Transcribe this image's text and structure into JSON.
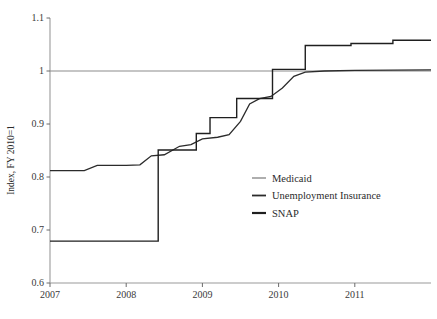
{
  "chart_data": {
    "type": "line",
    "title": "",
    "subtitle": "",
    "xlabel": "",
    "ylabel": "Index, FY 2010=1",
    "xlim": [
      2007.0,
      2012.0
    ],
    "ylim": [
      0.6,
      1.1
    ],
    "xticks": [
      2007,
      2008,
      2009,
      2010,
      2011
    ],
    "xticklabels": [
      "2007",
      "2008",
      "2009",
      "2010",
      "2011"
    ],
    "yticks": [
      0.6,
      0.7,
      0.8,
      0.9,
      1.0,
      1.1
    ],
    "yticklabels": [
      "0.6",
      "0.7",
      "0.8",
      "0.9",
      "1",
      "1.1"
    ],
    "grid": false,
    "legend_position": "center-right",
    "series": [
      {
        "name": "Medicaid",
        "color": "#8c8c8c",
        "width": 1.2,
        "step": false,
        "points": [
          [
            2007.0,
            1.0
          ],
          [
            2012.0,
            1.0
          ]
        ]
      },
      {
        "name": "Unemployment Insurance",
        "color": "#2b2b2b",
        "width": 1.3,
        "step": false,
        "points": [
          [
            2007.0,
            0.812
          ],
          [
            2007.45,
            0.812
          ],
          [
            2007.62,
            0.822
          ],
          [
            2008.0,
            0.822
          ],
          [
            2008.18,
            0.823
          ],
          [
            2008.33,
            0.84
          ],
          [
            2008.5,
            0.842
          ],
          [
            2008.7,
            0.858
          ],
          [
            2008.85,
            0.861
          ],
          [
            2009.0,
            0.872
          ],
          [
            2009.2,
            0.875
          ],
          [
            2009.35,
            0.88
          ],
          [
            2009.5,
            0.905
          ],
          [
            2009.62,
            0.938
          ],
          [
            2009.75,
            0.948
          ],
          [
            2009.9,
            0.952
          ],
          [
            2010.05,
            0.968
          ],
          [
            2010.2,
            0.99
          ],
          [
            2010.35,
            0.998
          ],
          [
            2010.6,
            1.0
          ],
          [
            2011.0,
            1.001
          ],
          [
            2012.0,
            1.002
          ]
        ]
      },
      {
        "name": "SNAP",
        "color": "#1f1f1f",
        "width": 1.4,
        "step": true,
        "points": [
          [
            2007.0,
            0.679
          ],
          [
            2008.42,
            0.679
          ],
          [
            2008.42,
            0.851
          ],
          [
            2008.92,
            0.851
          ],
          [
            2008.92,
            0.882
          ],
          [
            2009.1,
            0.882
          ],
          [
            2009.1,
            0.912
          ],
          [
            2009.45,
            0.912
          ],
          [
            2009.45,
            0.948
          ],
          [
            2009.92,
            0.948
          ],
          [
            2009.92,
            1.003
          ],
          [
            2010.35,
            1.003
          ],
          [
            2010.35,
            1.048
          ],
          [
            2010.95,
            1.048
          ],
          [
            2010.95,
            1.052
          ],
          [
            2011.5,
            1.052
          ],
          [
            2011.5,
            1.058
          ],
          [
            2012.0,
            1.058
          ]
        ]
      }
    ],
    "legend": [
      {
        "label": "Medicaid",
        "color": "#8c8c8c"
      },
      {
        "label": "Unemployment Insurance",
        "color": "#2b2b2b"
      },
      {
        "label": "SNAP",
        "color": "#1f1f1f"
      }
    ]
  },
  "axes": {
    "y_axis_title": "Index, FY 2010=1"
  },
  "style": {
    "background": "#ffffff",
    "axis_color": "#9a9a9a",
    "tick_color": "#6b6b6b",
    "text_color": "#2b2b2b"
  }
}
